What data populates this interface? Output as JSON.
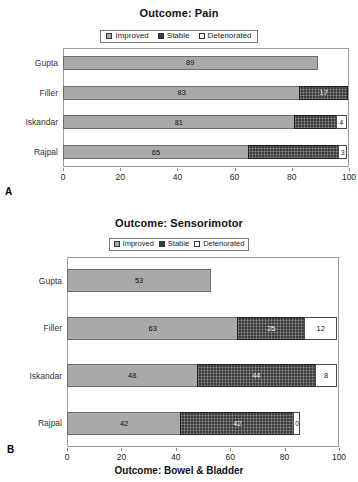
{
  "figure": {
    "bottom_caption": "Outcome: Bowel & Bladder",
    "panel_a_letter": "A",
    "panel_b_letter": "B"
  },
  "legend": {
    "improved": "Improved",
    "stable": "Stable",
    "deteriorated": "Deteriorated",
    "colors": {
      "improved": "#a9a9a9",
      "stable": "#3c3c3c",
      "deteriorated": "#ffffff"
    }
  },
  "chart_data": [
    {
      "type": "bar",
      "orientation": "horizontal",
      "stacked": true,
      "panel": "A",
      "title": "Outcome: Pain",
      "xlabel": "",
      "ylabel": "",
      "xlim": [
        0,
        100
      ],
      "xticks": [
        0,
        20,
        40,
        60,
        80,
        100
      ],
      "xtick_labels": [
        "0",
        "20",
        "40",
        "60",
        "80",
        "100"
      ],
      "grid": false,
      "legend_position": "top-center",
      "categories": [
        "Gupta",
        "Filler",
        "Iskandar",
        "Rajpal"
      ],
      "series": [
        {
          "name": "Improved",
          "values": [
            89,
            83,
            81,
            65
          ]
        },
        {
          "name": "Stable",
          "values": [
            0,
            17,
            15,
            32
          ]
        },
        {
          "name": "Deteriorated",
          "values": [
            0,
            0,
            4,
            3
          ]
        }
      ],
      "bar_labels": [
        [
          "89",
          "",
          ""
        ],
        [
          "83",
          "17",
          ""
        ],
        [
          "81",
          "",
          "4"
        ],
        [
          "65",
          "",
          "3"
        ]
      ]
    },
    {
      "type": "bar",
      "orientation": "horizontal",
      "stacked": true,
      "panel": "B",
      "title": "Outcome: Sensorimotor",
      "xlabel": "",
      "ylabel": "",
      "xlim": [
        0,
        100
      ],
      "xticks": [
        0,
        20,
        40,
        60,
        80,
        100
      ],
      "xtick_labels": [
        "0",
        "20",
        "40",
        "60",
        "80",
        "100"
      ],
      "grid": false,
      "legend_position": "top-center",
      "categories": [
        "Gupta",
        "Filler",
        "Iskandar",
        "Rajpal"
      ],
      "series": [
        {
          "name": "Improved",
          "values": [
            53,
            63,
            48,
            42
          ]
        },
        {
          "name": "Stable",
          "values": [
            0,
            25,
            44,
            42
          ]
        },
        {
          "name": "Deteriorated",
          "values": [
            0,
            12,
            8,
            0
          ]
        }
      ],
      "bar_labels": [
        [
          "53",
          "",
          ""
        ],
        [
          "63",
          "25",
          "12"
        ],
        [
          "48",
          "44",
          "8"
        ],
        [
          "42",
          "42",
          "0"
        ]
      ]
    }
  ]
}
